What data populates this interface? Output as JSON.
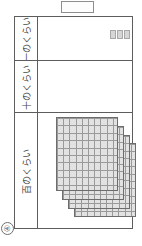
{
  "worksheet": {
    "problem_number": "④",
    "answer_box": {
      "value": "",
      "placeholder": ""
    }
  },
  "place_value_table": {
    "rows": [
      {
        "key": "ones",
        "label": "一のくらい",
        "block_type": "unit-cube",
        "block_count": 3,
        "block_value": 1,
        "total": 3
      },
      {
        "key": "tens",
        "label": "十のくらい",
        "block_type": "ten-rod",
        "block_count": 0,
        "block_value": 10,
        "total": 0
      },
      {
        "key": "hundreds",
        "label": "百のくらい",
        "block_type": "hundred-flat",
        "block_count": 4,
        "block_value": 100,
        "total": 400
      }
    ],
    "flat_grid": {
      "columns": 10,
      "rows": 10
    }
  },
  "colors": {
    "border": "#5d5d5d",
    "block_fill": "#e2e2e2",
    "block_line": "#9a9a9a",
    "text": "#4a4a4a"
  }
}
